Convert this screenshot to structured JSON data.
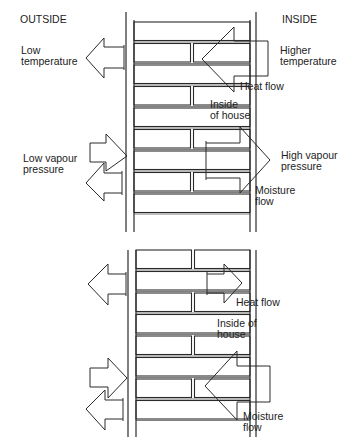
{
  "top_diagram": {
    "labels": {
      "outside": "OUTSIDE",
      "inside": "INSIDE",
      "low_temperature": "Low\ntemperature",
      "higher_temperature": "Higher\ntemperature",
      "heat_flow": "Heat flow",
      "inside_of_house": "Inside\nof house",
      "low_vapour_pressure": "Low vapour\npressure",
      "high_vapour_pressure": "High vapour\npressure",
      "moisture_flow": "Moisture\nflow"
    }
  },
  "bottom_diagram": {
    "labels": {
      "heat_flow": "Heat flow",
      "inside_of_house": "Inside of\nhouse",
      "moisture_flow": "Moisture\nflow"
    }
  },
  "colors": {
    "line": "#2a2a2a",
    "background": "#ffffff"
  }
}
